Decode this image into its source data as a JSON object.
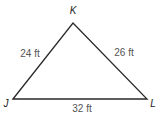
{
  "figure": {
    "shape": "triangle",
    "stroke_color": "#2a2a2a",
    "label_color": "#555555",
    "vertices": [
      {
        "name": "K",
        "x": 73,
        "y": 23,
        "label_x": 73,
        "label_y": 14
      },
      {
        "name": "J",
        "x": 13,
        "y": 99,
        "label_x": 6,
        "label_y": 107
      },
      {
        "name": "L",
        "x": 147,
        "y": 99,
        "label_x": 153,
        "label_y": 107
      }
    ],
    "sides": [
      {
        "from": "J",
        "to": "K",
        "length": "24 ft",
        "label_x": 30,
        "label_y": 57
      },
      {
        "from": "K",
        "to": "L",
        "length": "26 ft",
        "label_x": 124,
        "label_y": 56
      },
      {
        "from": "J",
        "to": "L",
        "length": "32 ft",
        "label_x": 82,
        "label_y": 112
      }
    ]
  }
}
